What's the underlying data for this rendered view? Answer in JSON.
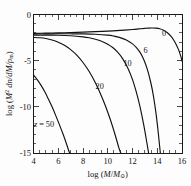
{
  "figure": {
    "background_color": "#fdfdfd",
    "curve_color": "#111111",
    "axis_color": "#1a1a1a"
  },
  "chart_data": {
    "type": "line",
    "title": "",
    "xlabel": "log (M/M_sun)",
    "ylabel": "log (M^2 dn/dM/rho_m)",
    "xlim": [
      4,
      16
    ],
    "ylim": [
      -15,
      0
    ],
    "xticks": [
      4,
      6,
      8,
      10,
      12,
      14,
      16
    ],
    "xtick_labels": [
      "4",
      "6",
      "8",
      "10",
      "12",
      "14",
      "16"
    ],
    "yticks": [
      0,
      -5,
      -10,
      -15
    ],
    "ytick_labels": [
      "0",
      "-5",
      "-10",
      "-15"
    ],
    "x_minor_step": 0.5,
    "y_minor_step": 1,
    "grid": false,
    "legend": "inline-curve-labels",
    "series": [
      {
        "name": "z = 0",
        "label": "0",
        "label_x": 14.55,
        "label_y": -2.35,
        "points": [
          [
            4.0,
            -2.05
          ],
          [
            5.0,
            -2.02
          ],
          [
            6.0,
            -1.99
          ],
          [
            7.0,
            -1.95
          ],
          [
            8.0,
            -1.91
          ],
          [
            9.0,
            -1.86
          ],
          [
            10.0,
            -1.8
          ],
          [
            11.0,
            -1.72
          ],
          [
            12.0,
            -1.62
          ],
          [
            12.5,
            -1.56
          ],
          [
            13.0,
            -1.5
          ],
          [
            13.3,
            -1.47
          ],
          [
            13.6,
            -1.46
          ],
          [
            13.9,
            -1.48
          ],
          [
            14.2,
            -1.55
          ],
          [
            14.5,
            -1.7
          ],
          [
            14.8,
            -1.95
          ],
          [
            15.1,
            -2.35
          ],
          [
            15.4,
            -2.92
          ],
          [
            15.7,
            -3.75
          ],
          [
            15.9,
            -4.5
          ],
          [
            16.0,
            -5.05
          ]
        ]
      },
      {
        "name": "z = 6",
        "label": "6",
        "label_x": 13.05,
        "label_y": -4.15,
        "points": [
          [
            4.0,
            -2.12
          ],
          [
            5.0,
            -2.1
          ],
          [
            6.0,
            -2.09
          ],
          [
            7.0,
            -2.09
          ],
          [
            8.0,
            -2.1
          ],
          [
            9.0,
            -2.14
          ],
          [
            10.0,
            -2.24
          ],
          [
            10.5,
            -2.34
          ],
          [
            11.0,
            -2.5
          ],
          [
            11.5,
            -2.76
          ],
          [
            12.0,
            -3.18
          ],
          [
            12.3,
            -3.55
          ],
          [
            12.6,
            -4.08
          ],
          [
            12.9,
            -4.85
          ],
          [
            13.2,
            -5.95
          ],
          [
            13.5,
            -7.5
          ],
          [
            13.7,
            -8.9
          ],
          [
            13.9,
            -10.7
          ],
          [
            14.05,
            -12.4
          ],
          [
            14.18,
            -14.1
          ],
          [
            14.25,
            -15.0
          ]
        ]
      },
      {
        "name": "z = 10",
        "label": "10",
        "label_x": 11.6,
        "label_y": -5.6,
        "points": [
          [
            4.0,
            -2.25
          ],
          [
            5.0,
            -2.24
          ],
          [
            6.0,
            -2.25
          ],
          [
            7.0,
            -2.3
          ],
          [
            8.0,
            -2.42
          ],
          [
            8.5,
            -2.52
          ],
          [
            9.0,
            -2.68
          ],
          [
            9.5,
            -2.9
          ],
          [
            10.0,
            -3.22
          ],
          [
            10.4,
            -3.58
          ],
          [
            10.8,
            -4.08
          ],
          [
            11.2,
            -4.78
          ],
          [
            11.6,
            -5.75
          ],
          [
            12.0,
            -7.05
          ],
          [
            12.3,
            -8.35
          ],
          [
            12.6,
            -9.95
          ],
          [
            12.9,
            -11.9
          ],
          [
            13.15,
            -13.8
          ],
          [
            13.3,
            -15.0
          ]
        ]
      },
      {
        "name": "z = 20",
        "label": "20",
        "label_x": 9.35,
        "label_y": -8.05,
        "points": [
          [
            4.0,
            -2.48
          ],
          [
            4.5,
            -2.52
          ],
          [
            5.0,
            -2.6
          ],
          [
            5.5,
            -2.76
          ],
          [
            6.0,
            -3.0
          ],
          [
            6.5,
            -3.34
          ],
          [
            7.0,
            -3.8
          ],
          [
            7.5,
            -4.4
          ],
          [
            8.0,
            -5.2
          ],
          [
            8.5,
            -6.18
          ],
          [
            9.0,
            -7.4
          ],
          [
            9.4,
            -8.55
          ],
          [
            9.8,
            -9.85
          ],
          [
            10.2,
            -11.35
          ],
          [
            10.6,
            -13.05
          ],
          [
            10.9,
            -14.45
          ],
          [
            11.05,
            -15.0
          ]
        ]
      },
      {
        "name": "z = 50",
        "label": "z = 50",
        "label_x": 4.85,
        "label_y": -12.15,
        "points": [
          [
            4.0,
            -6.55
          ],
          [
            4.3,
            -7.05
          ],
          [
            4.6,
            -7.65
          ],
          [
            4.9,
            -8.35
          ],
          [
            5.2,
            -9.15
          ],
          [
            5.5,
            -10.0
          ],
          [
            5.8,
            -10.95
          ],
          [
            6.1,
            -11.95
          ],
          [
            6.4,
            -13.0
          ],
          [
            6.65,
            -13.95
          ],
          [
            6.85,
            -14.75
          ],
          [
            6.93,
            -15.0
          ]
        ]
      }
    ]
  },
  "axis_labels": {
    "x_prefix": "log (",
    "x_var_m": "M",
    "x_slash": "/",
    "x_var_msun": "M",
    "x_sub_sun": "⊙",
    "x_suffix": ")",
    "y_prefix": "log (",
    "y_var_m": "M",
    "y_sup": "2",
    "y_mid": " dn/dM/",
    "y_rho": "ρ",
    "y_sub": "m",
    "y_suffix": ")"
  }
}
